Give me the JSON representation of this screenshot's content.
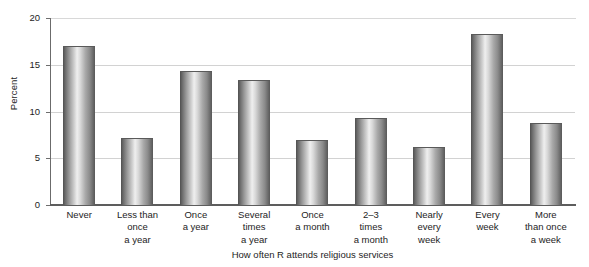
{
  "chart_data": {
    "type": "bar",
    "title": "",
    "xlabel": "How often R attends religious services",
    "ylabel": "Percent",
    "ylim": [
      0,
      20
    ],
    "yticks": [
      0,
      5,
      10,
      15,
      20
    ],
    "ytick_labels": [
      "0",
      "5",
      "10",
      "15",
      "20"
    ],
    "grid": true,
    "legend": "none",
    "categories": [
      "Never",
      "Less than once a year",
      "Once a year",
      "Several times a year",
      "Once a month",
      "2–3 times a month",
      "Nearly every week",
      "Every week",
      "More than once a week"
    ],
    "category_lines": [
      [
        "Never"
      ],
      [
        "Less than",
        "once",
        "a year"
      ],
      [
        "Once",
        "a year"
      ],
      [
        "Several",
        "times",
        "a year"
      ],
      [
        "Once",
        "a month"
      ],
      [
        "2–3",
        "times",
        "a month"
      ],
      [
        "Nearly",
        "every",
        "week"
      ],
      [
        "Every",
        "week"
      ],
      [
        "More",
        "than once",
        "a week"
      ]
    ],
    "values": [
      17.0,
      7.2,
      14.3,
      13.4,
      7.0,
      9.3,
      6.2,
      18.3,
      8.8
    ]
  },
  "style": {
    "bar_edge_color": "#5a5a5a",
    "bar_light_color": "#efefef",
    "bar_dark_color": "#4f4f4f",
    "grid_color": "#d2d2d2",
    "axis_color": "#5d5d5d",
    "text_color": "#1d1d1d",
    "background": "#ffffff"
  }
}
